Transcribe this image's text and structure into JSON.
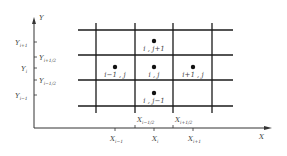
{
  "diagram": {
    "type": "finite-volume staggered grid",
    "axes": {
      "x_label": "X",
      "y_label": "Y"
    },
    "y_ticks": [
      {
        "base": "Y",
        "sub": "i+1",
        "side": "left"
      },
      {
        "base": "Y",
        "sub": "i+1/2",
        "side": "right"
      },
      {
        "base": "Y",
        "sub": "i",
        "side": "left"
      },
      {
        "base": "Y",
        "sub": "i−1/2",
        "side": "right"
      },
      {
        "base": "Y",
        "sub": "i−1",
        "side": "left"
      }
    ],
    "x_ticks_top": [
      {
        "base": "X",
        "sub": "i−1/2"
      },
      {
        "base": "X",
        "sub": "i+1/2"
      }
    ],
    "x_ticks_bottom": [
      {
        "base": "X",
        "sub": "i−1"
      },
      {
        "base": "X",
        "sub": "i"
      },
      {
        "base": "X",
        "sub": "i+1"
      }
    ],
    "nodes": [
      {
        "label": "i , j+1"
      },
      {
        "label": "i−1 , j"
      },
      {
        "label": "i , j"
      },
      {
        "label": "i+1 , j"
      },
      {
        "label": "i , j−1"
      }
    ],
    "colors": {
      "line": "#1a1a1a",
      "text": "#444444",
      "background": "#ffffff"
    }
  }
}
